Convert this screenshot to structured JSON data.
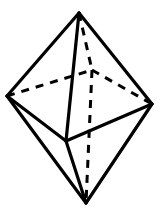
{
  "figure": {
    "title": "Trigonal bipyramid wireframe",
    "shape_name": "triangular bipyramid",
    "background_color": "#ffffff",
    "stroke_color": "#000000",
    "solid_stroke_width": 3.2,
    "hidden_stroke_width": 3.0,
    "hidden_dash_pattern": "8 7",
    "canvas": {
      "width": 161,
      "height": 214
    },
    "vertices": [
      {
        "id": "top-apex",
        "label": "top apex",
        "x": 79,
        "y": 13,
        "visible": true
      },
      {
        "id": "left",
        "label": "left equatorial",
        "x": 7,
        "y": 96,
        "visible": true
      },
      {
        "id": "right",
        "label": "right equatorial",
        "x": 152,
        "y": 104,
        "visible": true
      },
      {
        "id": "front",
        "label": "front equatorial",
        "x": 66,
        "y": 141,
        "visible": true
      },
      {
        "id": "back",
        "label": "back equatorial",
        "x": 92,
        "y": 70,
        "visible": false
      },
      {
        "id": "bottom-apex",
        "label": "bottom apex",
        "x": 86,
        "y": 203,
        "visible": true
      }
    ],
    "edges": [
      {
        "id": "top-left",
        "from": "top-apex",
        "to": "left",
        "style": "solid"
      },
      {
        "id": "top-right",
        "from": "top-apex",
        "to": "right",
        "style": "solid"
      },
      {
        "id": "top-front",
        "from": "top-apex",
        "to": "front",
        "style": "solid"
      },
      {
        "id": "top-back",
        "from": "top-apex",
        "to": "back",
        "style": "hidden"
      },
      {
        "id": "left-front",
        "from": "left",
        "to": "front",
        "style": "solid"
      },
      {
        "id": "front-right",
        "from": "front",
        "to": "right",
        "style": "solid"
      },
      {
        "id": "left-back",
        "from": "left",
        "to": "back",
        "style": "hidden"
      },
      {
        "id": "back-right",
        "from": "back",
        "to": "right",
        "style": "hidden"
      },
      {
        "id": "left-bottom",
        "from": "left",
        "to": "bottom-apex",
        "style": "solid"
      },
      {
        "id": "right-bottom",
        "from": "right",
        "to": "bottom-apex",
        "style": "solid"
      },
      {
        "id": "front-bottom",
        "from": "front",
        "to": "bottom-apex",
        "style": "solid"
      },
      {
        "id": "back-bottom",
        "from": "back",
        "to": "bottom-apex",
        "style": "hidden"
      }
    ],
    "faces": [
      {
        "id": "upper-left-front",
        "vertices": [
          "top-apex",
          "left",
          "front"
        ]
      },
      {
        "id": "upper-front-right",
        "vertices": [
          "top-apex",
          "front",
          "right"
        ]
      },
      {
        "id": "lower-left-front",
        "vertices": [
          "bottom-apex",
          "left",
          "front"
        ]
      },
      {
        "id": "lower-front-right",
        "vertices": [
          "bottom-apex",
          "front",
          "right"
        ]
      }
    ],
    "counts": {
      "vertices": 6,
      "edges": 9,
      "faces": 6
    }
  }
}
